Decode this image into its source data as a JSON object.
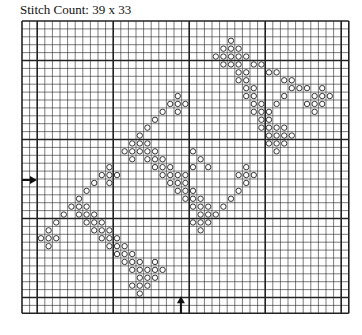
{
  "title": "Stitch Count: 39 x 33",
  "chart_data": {
    "type": "heatmap",
    "title": "Stitch Count: 39 x 33",
    "stitch_count": {
      "width": 39,
      "height": 33
    },
    "grid": {
      "columns": 43,
      "rows": 37,
      "major_every": 10,
      "major_col_offset": 2,
      "major_row_offset": 5
    },
    "symbol": "o",
    "center_markers": {
      "left_arrow_row": 20,
      "bottom_arrow_col": 21
    },
    "stitches": {
      "2": [
        27
      ],
      "3": [
        26,
        27,
        28
      ],
      "4": [
        25,
        26,
        27,
        28,
        29
      ],
      "5": [
        26,
        27,
        28,
        30,
        31
      ],
      "6": [
        28,
        29,
        32,
        33
      ],
      "7": [
        28,
        29,
        34,
        35
      ],
      "8": [
        29,
        30,
        35,
        36,
        37,
        39
      ],
      "9": [
        20,
        29,
        30,
        34,
        38,
        39,
        40
      ],
      "10": [
        19,
        20,
        21,
        30,
        31,
        33,
        37,
        38,
        39
      ],
      "11": [
        18,
        20,
        30,
        31,
        32,
        38
      ],
      "12": [
        17,
        31,
        32
      ],
      "13": [
        16,
        31,
        32,
        33,
        34
      ],
      "14": [
        15,
        32,
        33,
        34,
        35
      ],
      "15": [
        14,
        15,
        16,
        32,
        33,
        34
      ],
      "16": [
        13,
        14,
        15,
        16,
        17,
        22,
        33
      ],
      "17": [
        14,
        16,
        17,
        18,
        23
      ],
      "18": [
        11,
        17,
        18,
        19,
        22,
        24,
        29
      ],
      "19": [
        10,
        11,
        12,
        18,
        19,
        20,
        21,
        28,
        29,
        30
      ],
      "20": [
        9,
        11,
        19,
        20,
        21,
        29
      ],
      "21": [
        8,
        20,
        21,
        22,
        28
      ],
      "22": [
        7,
        21,
        22,
        23,
        27
      ],
      "23": [
        6,
        7,
        8,
        22,
        23,
        24,
        26
      ],
      "24": [
        5,
        7,
        8,
        9,
        23,
        24,
        25
      ],
      "25": [
        4,
        8,
        9,
        10,
        22,
        23,
        24
      ],
      "26": [
        3,
        9,
        10,
        11,
        23
      ],
      "27": [
        2,
        3,
        4,
        10,
        11,
        12
      ],
      "28": [
        3,
        11,
        12,
        13
      ],
      "29": [
        12,
        13,
        14
      ],
      "30": [
        13,
        14,
        15,
        17
      ],
      "31": [
        14,
        15,
        16,
        17,
        18
      ],
      "32": [
        15,
        16,
        17
      ],
      "33": [
        14,
        15,
        16
      ],
      "34": [
        15
      ]
    }
  }
}
